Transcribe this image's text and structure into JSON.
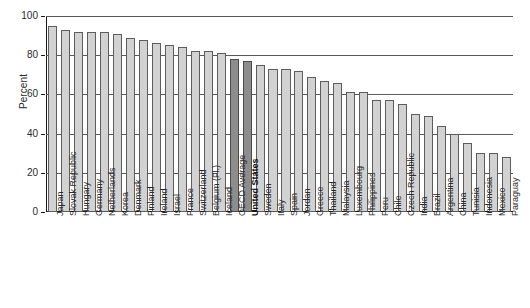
{
  "chart_data": {
    "type": "bar",
    "title": "",
    "xlabel": "",
    "ylabel": "Percent",
    "ylim": [
      0,
      100
    ],
    "yticks": [
      0,
      20,
      40,
      60,
      80,
      100
    ],
    "grid": true,
    "legend": "none",
    "highlight_color": "#8d8d8d",
    "bar_color": "#d2d2d2",
    "categories": [
      "Japan",
      "Slovak Republic",
      "Hungary",
      "Germany",
      "Netherlands",
      "Korea",
      "Denmark",
      "Finland",
      "Ireland",
      "Israel",
      "France",
      "Switzerland",
      "Belgium (Fl.)",
      "Iceland",
      "OECD Average",
      "United States",
      "Sweden",
      "Italy",
      "Spain",
      "Jordan",
      "Greece",
      "Thailand",
      "Malaysia",
      "Luxembourg",
      "Philippines",
      "Peru",
      "Chile",
      "Czech Republic",
      "India",
      "Brazil",
      "Argentina",
      "China",
      "Tunisia",
      "Indonesia",
      "Mexico",
      "Paraguay"
    ],
    "values": [
      95,
      93,
      92,
      92,
      92,
      91,
      89,
      88,
      86,
      85,
      84,
      82,
      82,
      81,
      78,
      77,
      75,
      73,
      73,
      72,
      69,
      67,
      66,
      61,
      61,
      57,
      57,
      55,
      50,
      49,
      44,
      40,
      35,
      30,
      30,
      28
    ],
    "highlighted": [
      "OECD Average",
      "United States"
    ],
    "bold_labels": [
      "United States"
    ]
  }
}
